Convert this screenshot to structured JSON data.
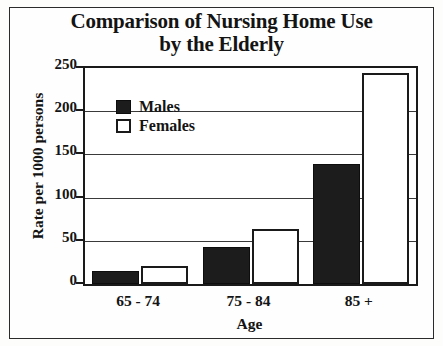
{
  "chart_data": {
    "type": "bar",
    "title": "Comparison of Nursing Home Use by the Elderly",
    "title_line1": "Comparison of Nursing Home Use",
    "title_line2": "by the Elderly",
    "xlabel": "Age",
    "ylabel": "Rate per 1000 persons",
    "categories": [
      "65 - 74",
      "75 - 84",
      "85 +"
    ],
    "series": [
      {
        "name": "Males",
        "color": "#1c1c1c",
        "values": [
          15,
          43,
          139
        ]
      },
      {
        "name": "Females",
        "color": "#ffffff",
        "values": [
          21,
          64,
          244
        ]
      }
    ],
    "ylim": [
      0,
      250
    ],
    "yticks": [
      0,
      50,
      100,
      150,
      200,
      250
    ],
    "ytick_labels": [
      "0",
      "50",
      "100",
      "150",
      "200",
      "250"
    ],
    "grid": true,
    "legend_position": "upper-left-inside",
    "legend": [
      "Males",
      "Females"
    ]
  }
}
